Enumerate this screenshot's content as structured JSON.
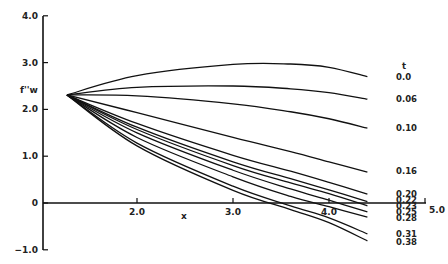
{
  "chart_data": {
    "type": "line",
    "title": "",
    "xlabel": "x",
    "ylabel": "f''w",
    "legend_title": "t",
    "xlim": [
      1.0,
      5.0
    ],
    "ylim": [
      -1.0,
      4.0
    ],
    "x_ticks": [
      "2.0",
      "3.0",
      "4.0",
      "5.0"
    ],
    "y_ticks": [
      "4.0",
      "3.0",
      "2.0",
      "1.0",
      "0",
      "-1.0"
    ],
    "grid": false,
    "start_point": {
      "x": 1.27,
      "y": 2.31
    },
    "series": [
      {
        "name": "0.0",
        "x": [
          1.27,
          2.0,
          3.0,
          3.6,
          4.0,
          4.4
        ],
        "y": [
          2.31,
          2.72,
          2.96,
          2.97,
          2.9,
          2.7
        ]
      },
      {
        "name": "0.06",
        "x": [
          1.27,
          2.0,
          3.0,
          3.6,
          4.0,
          4.4
        ],
        "y": [
          2.31,
          2.47,
          2.5,
          2.44,
          2.36,
          2.22
        ]
      },
      {
        "name": "0.10",
        "x": [
          1.27,
          2.0,
          3.0,
          3.6,
          4.0,
          4.4
        ],
        "y": [
          2.31,
          2.29,
          2.12,
          1.95,
          1.8,
          1.6
        ]
      },
      {
        "name": "0.16",
        "x": [
          1.27,
          2.0,
          3.0,
          3.6,
          4.0,
          4.4
        ],
        "y": [
          2.31,
          1.93,
          1.4,
          1.1,
          0.88,
          0.66
        ]
      },
      {
        "name": "0.20",
        "x": [
          1.27,
          2.0,
          3.0,
          3.6,
          4.0,
          4.4
        ],
        "y": [
          2.31,
          1.7,
          1.02,
          0.68,
          0.44,
          0.19
        ]
      },
      {
        "name": "0.22",
        "x": [
          1.27,
          2.0,
          3.0,
          3.6,
          4.0,
          4.4
        ],
        "y": [
          2.31,
          1.62,
          0.88,
          0.52,
          0.28,
          0.03
        ]
      },
      {
        "name": "0.23",
        "x": [
          1.27,
          2.0,
          3.0,
          3.6,
          4.0,
          4.4
        ],
        "y": [
          2.31,
          1.57,
          0.8,
          0.43,
          0.2,
          -0.06
        ]
      },
      {
        "name": "0.25",
        "x": [
          1.27,
          2.0,
          3.0,
          3.6,
          4.0,
          4.4
        ],
        "y": [
          2.31,
          1.5,
          0.7,
          0.3,
          0.06,
          -0.19
        ]
      },
      {
        "name": "0.28",
        "x": [
          1.27,
          2.0,
          3.0,
          3.6,
          4.0,
          4.4
        ],
        "y": [
          2.31,
          1.4,
          0.56,
          0.14,
          -0.08,
          -0.3
        ]
      },
      {
        "name": "0.31",
        "x": [
          1.27,
          2.0,
          3.0,
          3.6,
          4.0,
          4.4
        ],
        "y": [
          2.31,
          1.28,
          0.36,
          -0.06,
          -0.32,
          -0.66
        ]
      },
      {
        "name": "0.38",
        "x": [
          1.27,
          2.0,
          3.0,
          3.6,
          4.0,
          4.4
        ],
        "y": [
          2.31,
          1.22,
          0.27,
          -0.14,
          -0.42,
          -0.81
        ]
      }
    ]
  }
}
